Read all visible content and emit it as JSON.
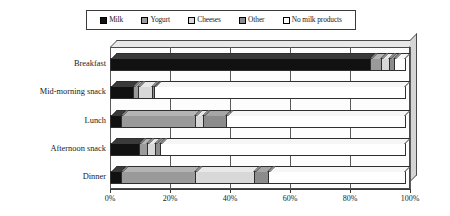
{
  "chart_data": {
    "type": "bar",
    "subtype": "stacked-horizontal-100pct-3d",
    "title": "",
    "xlabel": "",
    "ylabel": "",
    "xlim": [
      0,
      100
    ],
    "grid": true,
    "legend_position": "top",
    "xticks": [
      "0%",
      "20%",
      "40%",
      "60%",
      "80%",
      "100%"
    ],
    "xtick_values": [
      0,
      20,
      40,
      60,
      80,
      100
    ],
    "categories": [
      "Breakfast",
      "Mid-morning snack",
      "Lunch",
      "Afternoon snack",
      "Dinner"
    ],
    "series": [
      {
        "name": "Milk",
        "color": "#111111",
        "values": [
          87,
          8,
          4,
          10,
          4
        ]
      },
      {
        "name": "Yogurt",
        "color": "#9a9a9a",
        "values": [
          4,
          2,
          25,
          3,
          25
        ]
      },
      {
        "name": "Cheeses",
        "color": "#d8d8d8",
        "values": [
          3,
          5,
          3,
          3,
          20
        ]
      },
      {
        "name": "Other",
        "color": "#8c8c8c",
        "values": [
          2,
          1,
          8,
          2,
          5
        ]
      },
      {
        "name": "No milk products",
        "color": "#ffffff",
        "values": [
          4,
          84,
          60,
          82,
          46
        ]
      }
    ]
  },
  "legend": {
    "items": [
      {
        "label": "Milk",
        "swatch": "fill-milk"
      },
      {
        "label": "Yogurt",
        "swatch": "fill-yogurt"
      },
      {
        "label": "Cheeses",
        "swatch": "fill-cheeses"
      },
      {
        "label": "Other",
        "swatch": "fill-other"
      },
      {
        "label": "No milk products",
        "swatch": "fill-nomilk"
      }
    ]
  }
}
